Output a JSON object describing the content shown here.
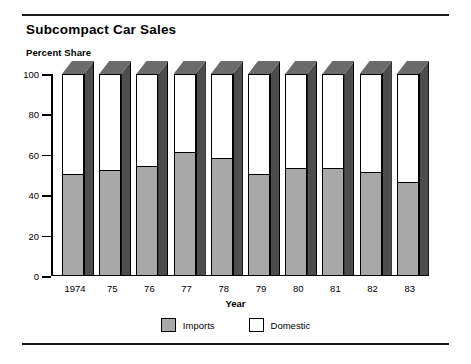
{
  "header": {
    "title": "Subcompact Car Sales",
    "subtitle": "Percent Share"
  },
  "colors": {
    "imports": "#a8a8a8",
    "domestic": "#ffffff",
    "bar_side": "#4d4d4d",
    "bar_top": "#6b6b6b",
    "outline": "#000000",
    "rule": "#1a1a1a"
  },
  "chart_data": {
    "type": "bar",
    "title": "Subcompact Car Sales",
    "subtitle": "Percent Share",
    "xlabel": "Year",
    "ylabel": "Percent Share",
    "stacked": true,
    "stack_total": 100,
    "grid": false,
    "legend_position": "bottom",
    "ylim": [
      0,
      100
    ],
    "yticks": [
      0,
      20,
      40,
      60,
      80,
      100
    ],
    "ytick_labels": [
      "0",
      "20",
      "40",
      "60",
      "80",
      "100"
    ],
    "categories": [
      "1974",
      "75",
      "76",
      "77",
      "78",
      "79",
      "80",
      "81",
      "82",
      "83"
    ],
    "series": [
      {
        "name": "Imports",
        "color": "#a8a8a8",
        "values": [
          50,
          52,
          54,
          61,
          58,
          50,
          53,
          53,
          51,
          46
        ]
      },
      {
        "name": "Domestic",
        "color": "#ffffff",
        "values": [
          50,
          48,
          46,
          39,
          42,
          50,
          47,
          47,
          49,
          54
        ]
      }
    ]
  },
  "legend": {
    "items": [
      {
        "label": "Imports",
        "color": "#a8a8a8"
      },
      {
        "label": "Domestic",
        "color": "#ffffff"
      }
    ]
  }
}
